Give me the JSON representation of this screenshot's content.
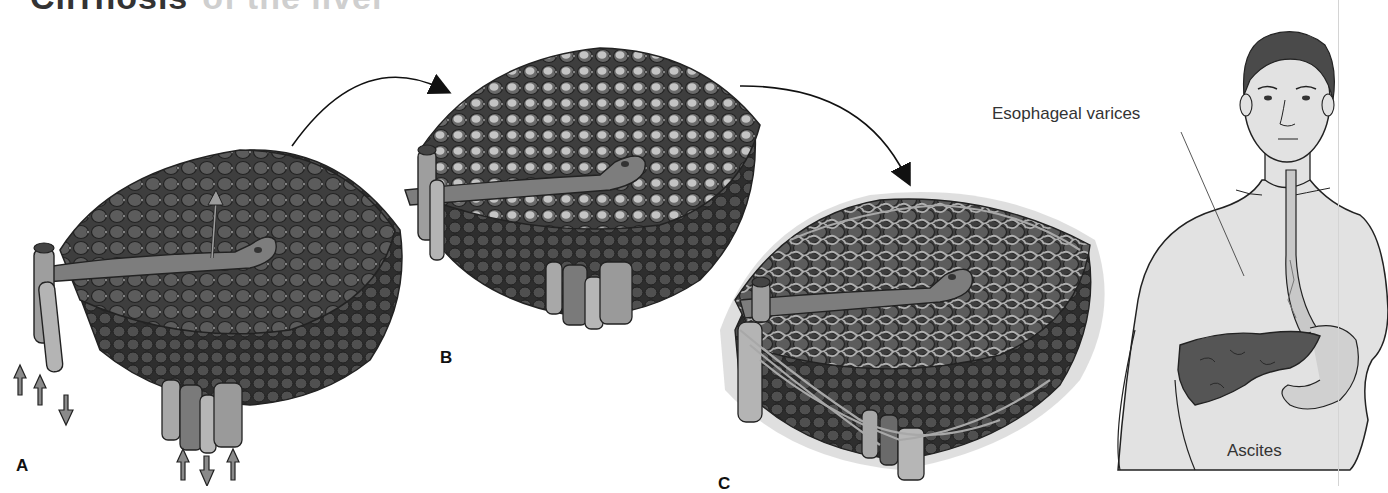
{
  "title": {
    "text": "Cirrhosis",
    "faded_text": "of the liver"
  },
  "panels": [
    {
      "id": "A",
      "label": "A",
      "description": "Normal liver lobule"
    },
    {
      "id": "B",
      "label": "B",
      "description": "Fatty liver lobule"
    },
    {
      "id": "C",
      "label": "C",
      "description": "Cirrhotic lobule with fibrous tissue"
    }
  ],
  "figure": {
    "callouts": {
      "varices": "Esophageal varices",
      "ascites": "Ascites"
    }
  },
  "colors": {
    "lobule_cell": "#5a5a5a",
    "lobule_fat": "#b8b8b8",
    "vessel": "#9a9a9a",
    "fibrous": "#a8a8a8",
    "skin": "#e3e3e3",
    "hair": "#4a4a4a",
    "liver": "#555555",
    "stroke": "#222222"
  }
}
